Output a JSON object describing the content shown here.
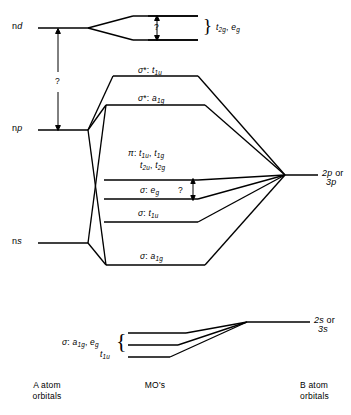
{
  "diagram": {
    "line_color": "#000000",
    "background": "#ffffff"
  },
  "left_atomic_orbitals": [
    {
      "name": "nd-level",
      "label_main": "n",
      "label_italic": "d",
      "y": 28
    },
    {
      "name": "np-level",
      "label_main": "n",
      "label_italic": "p",
      "y": 130
    },
    {
      "name": "ns-level",
      "label_main": "n",
      "label_italic": "s",
      "y": 243
    }
  ],
  "left_gap_annotation": {
    "symbol": "?",
    "from_level": "nd",
    "to_level": "np"
  },
  "nd_split": {
    "annotation": "?",
    "group_label_parts": [
      {
        "italic": "t",
        "sub": "2g"
      },
      {
        "text": ", "
      },
      {
        "italic": "e",
        "sub": "g"
      }
    ],
    "group_label_plain": "t2g, eg"
  },
  "mo_levels": [
    {
      "name": "sigma-star-t1u",
      "y": 76,
      "label_parts": [
        {
          "italic": "σ",
          "sup": "*"
        },
        {
          "text": ": "
        },
        {
          "italic": "t",
          "sub": "1u"
        }
      ],
      "label_plain": "σ*: t1u"
    },
    {
      "name": "sigma-star-a1g",
      "y": 105,
      "label_parts": [
        {
          "italic": "σ",
          "sup": "*"
        },
        {
          "text": ": "
        },
        {
          "italic": "a",
          "sub": "1g"
        }
      ],
      "label_plain": "σ*: a1g"
    },
    {
      "name": "pi-t1u-t1g-t2u-t2g",
      "y": 180,
      "label_plain": "π: t1u, t1g  t2u, t2g"
    },
    {
      "name": "sigma-eg",
      "y": 199,
      "label_plain": "σ: eg"
    },
    {
      "name": "sigma-t1u",
      "y": 222,
      "label_plain": "σ: t1u"
    },
    {
      "name": "sigma-a1g",
      "y": 265,
      "label_plain": "σ: a1g"
    }
  ],
  "mo_gap_annotation": {
    "symbol": "?",
    "between": [
      "pi-t1u-t1g-t2u-t2g",
      "sigma-eg"
    ]
  },
  "right_atomic_orbitals": [
    {
      "name": "2p-or-3p",
      "line1": "2p",
      "conj": "or",
      "line2": "3p",
      "y": 175
    },
    {
      "name": "2s-or-3s",
      "line1": "2s",
      "conj": "or",
      "line2": "3s",
      "y": 322
    }
  ],
  "lower_mo_block": {
    "levels": [
      {
        "name": "lower-mo-level-1",
        "y": 333
      },
      {
        "name": "lower-mo-level-2",
        "y": 345
      },
      {
        "name": "lower-mo-level-3",
        "y": 357
      }
    ],
    "label_line1_plain": "σ: a1g, eg",
    "label_line2_plain": "t1u"
  },
  "captions": {
    "left": {
      "line1": "A atom",
      "line2": "orbitals"
    },
    "center": {
      "line1": "MO's"
    },
    "right": {
      "line1": "B atom",
      "line2": "orbitals"
    }
  }
}
